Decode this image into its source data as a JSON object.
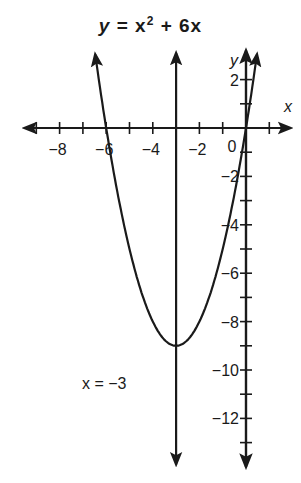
{
  "chart_data": {
    "type": "line",
    "title_parts": {
      "lhs": "y",
      "eq": "=",
      "base": "x",
      "exp": "2",
      "rest": "+ 6x"
    },
    "xlabel": "x",
    "ylabel": "y",
    "origin_label": "0",
    "xlim": [
      -9.5,
      1.9
    ],
    "ylim": [
      -14,
      3.2
    ],
    "grid": false,
    "x_tick_labels": [
      {
        "value": -8,
        "label": "−8"
      },
      {
        "value": -6,
        "label": "−6"
      },
      {
        "value": -4,
        "label": "−4"
      },
      {
        "value": -2,
        "label": "−2"
      }
    ],
    "y_tick_labels": [
      {
        "value": 2,
        "label": "2"
      },
      {
        "value": -2,
        "label": "−2"
      },
      {
        "value": -4,
        "label": "−4"
      },
      {
        "value": -6,
        "label": "−6"
      },
      {
        "value": -8,
        "label": "−8"
      },
      {
        "value": -10,
        "label": "−10"
      },
      {
        "value": -12,
        "label": "−12"
      }
    ],
    "series": [
      {
        "name": "y = x² + 6x",
        "kind": "parabola",
        "a": 1,
        "b": 6,
        "c": 0,
        "x_range": [
          -6.47,
          0.47
        ],
        "vertex": [
          -3,
          -9
        ]
      },
      {
        "name": "axis of symmetry",
        "kind": "vertical-line",
        "x": -3,
        "y_range": [
          -13.9,
          3.1
        ]
      }
    ],
    "annotations": [
      {
        "text": "x = −3",
        "x": -6.5,
        "y": -10.5
      }
    ]
  }
}
